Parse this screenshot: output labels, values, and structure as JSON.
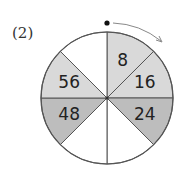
{
  "problem_label": "(2)",
  "wheel": {
    "center": [
      107,
      98
    ],
    "radius": 66,
    "direction": "clockwise",
    "colors": {
      "light": "#d9d9d9",
      "dark": "#bdbdbd",
      "empty": "#ffffff",
      "stroke": "#555555"
    },
    "segments": [
      {
        "index": 0,
        "value": "8",
        "fill": "light"
      },
      {
        "index": 1,
        "value": "16",
        "fill": "light"
      },
      {
        "index": 2,
        "value": "24",
        "fill": "dark"
      },
      {
        "index": 3,
        "value": "",
        "fill": "empty"
      },
      {
        "index": 4,
        "value": "",
        "fill": "empty"
      },
      {
        "index": 5,
        "value": "48",
        "fill": "dark"
      },
      {
        "index": 6,
        "value": "56",
        "fill": "light"
      },
      {
        "index": 7,
        "value": "",
        "fill": "empty"
      }
    ]
  }
}
